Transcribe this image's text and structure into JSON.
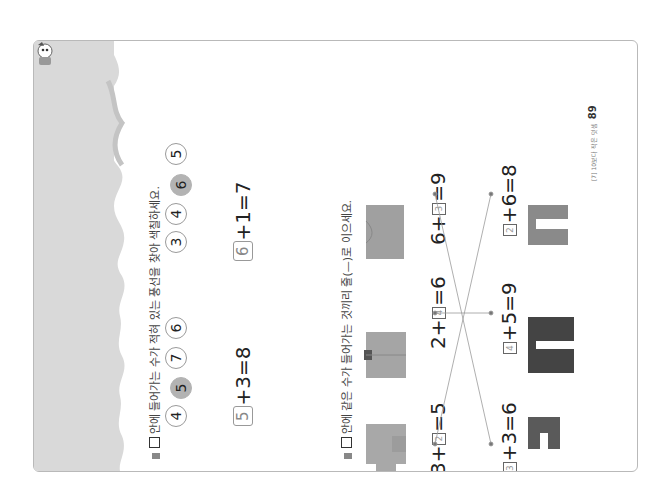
{
  "page": {
    "rotation": "-90deg",
    "band_color": "#d9d9d9",
    "accent_gray": "#b3b3b3"
  },
  "section1": {
    "instruction": "□ 안에 들어가는 수가 적혀 있는 풍선을 찾아 색칠하세요.",
    "instruction_text": "안에 들어가는 수가 적혀 있는 풍선을 찾아 색칠하세요.",
    "groups": [
      {
        "balloons": [
          {
            "value": "4",
            "filled": false
          },
          {
            "value": "5",
            "filled": true
          },
          {
            "value": "7",
            "filled": false
          },
          {
            "value": "6",
            "filled": false
          }
        ],
        "equation": {
          "answer": "5",
          "rest": "+3=8"
        }
      },
      {
        "balloons": [
          {
            "value": "3",
            "filled": false
          },
          {
            "value": "4",
            "filled": false
          },
          {
            "value": "6",
            "filled": true
          },
          {
            "value": "5",
            "filled": false
          }
        ],
        "equation": {
          "answer": "6",
          "rest": "+1=7"
        }
      }
    ]
  },
  "section2": {
    "instruction": "□ 안에 같은 수가 들어가는 것끼리 줄(—)로 이으세요.",
    "instruction_text": "안에 같은 수가 들어가는 것끼리 줄(—)로 이으세요.",
    "top_row": [
      {
        "item": "sweater",
        "pre": "3+",
        "answer": "2",
        "post": "=5"
      },
      {
        "item": "jacket",
        "pre": "2+",
        "answer": "4",
        "post": "=6"
      },
      {
        "item": "shirt",
        "pre": "6+",
        "answer": "3",
        "post": "=9"
      }
    ],
    "bottom_row": [
      {
        "item": "shorts",
        "pre": "",
        "answer": "3",
        "post": "+3=6"
      },
      {
        "item": "pants",
        "pre": "",
        "answer": "4",
        "post": "+5=9"
      },
      {
        "item": "leggings",
        "pre": "",
        "answer": "2",
        "post": "+6=8"
      }
    ],
    "connections": [
      {
        "from": "3+□=5",
        "to": "□+6=8"
      },
      {
        "from": "2+□=6",
        "to": "□+5=9"
      },
      {
        "from": "6+□=9",
        "to": "□+3=6"
      }
    ]
  },
  "footer": {
    "chapter": "[7] 10보다 작은 덧셈",
    "page_number": "89"
  }
}
